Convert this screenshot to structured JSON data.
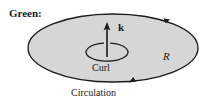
{
  "figure": {
    "title_label": "Green:",
    "region_label": "R",
    "normal_vector_label": "k",
    "curl_label": "Curl",
    "circulation_label": "Circulation",
    "colors": {
      "region_fill": "#d6d6d6",
      "stroke": "#1a1a1a",
      "background": "#ffffff"
    },
    "geometry": {
      "region_ellipse": {
        "cx": 113,
        "cy": 48,
        "rx": 85,
        "ry": 34
      },
      "curl_ellipse": {
        "cx": 107,
        "cy": 52,
        "rx": 21,
        "ry": 9
      },
      "normal_arrow": {
        "x": 107,
        "y_base": 56,
        "y_tip": 23
      }
    }
  }
}
